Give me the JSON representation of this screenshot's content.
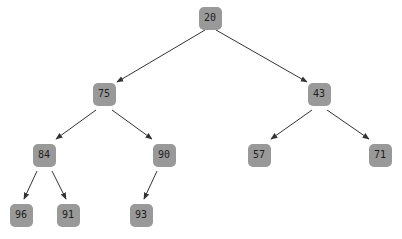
{
  "diagram": {
    "type": "binary-tree",
    "colors": {
      "node_fill": "#999999",
      "node_text": "#1e1e1e",
      "edge": "#333333",
      "background": "#ffffff"
    },
    "nodes": [
      {
        "id": "n20",
        "label": "20",
        "cx": 210,
        "cy": 18
      },
      {
        "id": "n75",
        "label": "75",
        "cx": 104,
        "cy": 94
      },
      {
        "id": "n43",
        "label": "43",
        "cx": 319,
        "cy": 94
      },
      {
        "id": "n84",
        "label": "84",
        "cx": 44,
        "cy": 155
      },
      {
        "id": "n90",
        "label": "90",
        "cx": 164,
        "cy": 155
      },
      {
        "id": "n57",
        "label": "57",
        "cx": 259,
        "cy": 155
      },
      {
        "id": "n71",
        "label": "71",
        "cx": 380,
        "cy": 155
      },
      {
        "id": "n96",
        "label": "96",
        "cx": 21,
        "cy": 215
      },
      {
        "id": "n91",
        "label": "91",
        "cx": 68,
        "cy": 215
      },
      {
        "id": "n93",
        "label": "93",
        "cx": 141,
        "cy": 215
      }
    ],
    "edges": [
      {
        "from": "20",
        "to": "75",
        "x1": 205,
        "y1": 30,
        "x2": 117,
        "y2": 82
      },
      {
        "from": "20",
        "to": "43",
        "x1": 216,
        "y1": 30,
        "x2": 307,
        "y2": 82
      },
      {
        "from": "75",
        "to": "84",
        "x1": 96,
        "y1": 110,
        "x2": 56,
        "y2": 139
      },
      {
        "from": "75",
        "to": "90",
        "x1": 112,
        "y1": 110,
        "x2": 152,
        "y2": 139
      },
      {
        "from": "43",
        "to": "57",
        "x1": 312,
        "y1": 110,
        "x2": 271,
        "y2": 139
      },
      {
        "from": "43",
        "to": "71",
        "x1": 327,
        "y1": 110,
        "x2": 369,
        "y2": 139
      },
      {
        "from": "84",
        "to": "96",
        "x1": 37,
        "y1": 171,
        "x2": 24,
        "y2": 199
      },
      {
        "from": "84",
        "to": "91",
        "x1": 52,
        "y1": 171,
        "x2": 66,
        "y2": 199
      },
      {
        "from": "90",
        "to": "93",
        "x1": 157,
        "y1": 171,
        "x2": 144,
        "y2": 199
      }
    ]
  }
}
